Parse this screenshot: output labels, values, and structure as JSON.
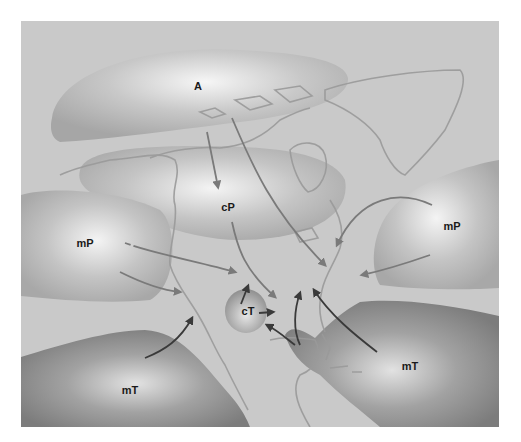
{
  "colors": {
    "background": "#c9c9c9",
    "land_outline": "#9a9a9a",
    "cold_mass_center": "#f2f2f2",
    "cold_mass_edge": "#a9a9a9",
    "warm_mass_center": "#dcdcdc",
    "warm_mass_edge": "#7f7f7f",
    "cold_arrow": "#7a7a7a",
    "warm_arrow": "#3a3a3a"
  },
  "air_masses": [
    {
      "id": "arctic",
      "label": "A",
      "type": "arctic",
      "x": 198,
      "y": 86
    },
    {
      "id": "continental-polar",
      "label": "cP",
      "type": "continental polar",
      "x": 228,
      "y": 207
    },
    {
      "id": "maritime-polar-pacific",
      "label": "mP",
      "type": "maritime polar",
      "x": 85,
      "y": 243
    },
    {
      "id": "maritime-polar-atlantic",
      "label": "mP",
      "type": "maritime polar",
      "x": 452,
      "y": 226
    },
    {
      "id": "continental-tropical",
      "label": "cT",
      "type": "continental tropical",
      "x": 248,
      "y": 311
    },
    {
      "id": "maritime-tropical-pacific",
      "label": "mT",
      "type": "maritime tropical",
      "x": 130,
      "y": 390
    },
    {
      "id": "maritime-tropical-atlantic",
      "label": "mT",
      "type": "maritime tropical",
      "x": 410,
      "y": 366
    }
  ]
}
